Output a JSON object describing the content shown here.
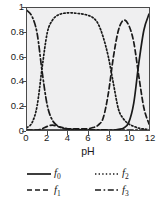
{
  "chart_data": {
    "type": "line",
    "title": "",
    "xlabel": "pH",
    "ylabel": "",
    "xlim": [
      0,
      12
    ],
    "ylim": [
      0,
      1
    ],
    "grid": false,
    "legend_position": "below",
    "xticks": [
      "0",
      "2",
      "4",
      "6",
      "8",
      "10",
      "12"
    ],
    "xtick_values": [
      0,
      2,
      4,
      6,
      8,
      10,
      12
    ],
    "yticks": [
      "0",
      "0.2",
      "0.4",
      "0.6",
      "0.8",
      "1"
    ],
    "ytick_values": [
      0,
      0.2,
      0.4,
      0.6,
      0.8,
      1
    ],
    "x": [
      0,
      0.5,
      1,
      1.5,
      2,
      2.5,
      3,
      3.5,
      4,
      4.5,
      5,
      5.5,
      6,
      6.5,
      7,
      7.5,
      8,
      8.5,
      9,
      9.5,
      10,
      10.5,
      11,
      11.5,
      12
    ],
    "series": [
      {
        "name": "f0",
        "label": "f",
        "subscript": "0",
        "linestyle": "solid",
        "color": "#1a1a1a",
        "values": [
          0,
          0,
          0,
          0,
          0,
          0,
          0,
          0,
          0,
          0,
          0,
          0,
          0,
          0,
          0,
          0,
          0,
          0,
          0.005,
          0.015,
          0.06,
          0.22,
          0.55,
          0.82,
          0.95
        ]
      },
      {
        "name": "f1",
        "label": "f",
        "subscript": "1",
        "linestyle": "dashed",
        "color": "#1a1a1a",
        "values": [
          0,
          0,
          0,
          0.01,
          0.03,
          0.04,
          0.03,
          0.02,
          0.01,
          0.01,
          0.01,
          0.01,
          0.01,
          0.02,
          0.04,
          0.1,
          0.3,
          0.6,
          0.82,
          0.9,
          0.86,
          0.72,
          0.44,
          0.18,
          0.05
        ]
      },
      {
        "name": "f2",
        "label": "f",
        "subscript": "2",
        "linestyle": "dotted",
        "color": "#1a1a1a",
        "values": [
          0.02,
          0.06,
          0.2,
          0.52,
          0.8,
          0.9,
          0.94,
          0.955,
          0.96,
          0.96,
          0.955,
          0.95,
          0.94,
          0.92,
          0.87,
          0.76,
          0.6,
          0.38,
          0.17,
          0.09,
          0.05,
          0.03,
          0.015,
          0.008,
          0.004
        ]
      },
      {
        "name": "f3",
        "label": "f",
        "subscript": "3",
        "linestyle": "dashdot",
        "color": "#1a1a1a",
        "values": [
          0.98,
          0.93,
          0.79,
          0.47,
          0.2,
          0.08,
          0.035,
          0.015,
          0.008,
          0.005,
          0.003,
          0.002,
          0.002,
          0.001,
          0.001,
          0.001,
          0,
          0,
          0,
          0,
          0,
          0,
          0,
          0,
          0
        ]
      }
    ],
    "legend": [
      {
        "name": "f0",
        "label": "f",
        "subscript": "0",
        "linestyle": "solid"
      },
      {
        "name": "f2",
        "label": "f",
        "subscript": "2",
        "linestyle": "dotted"
      },
      {
        "name": "f1",
        "label": "f",
        "subscript": "1",
        "linestyle": "dashed"
      },
      {
        "name": "f3",
        "label": "f",
        "subscript": "3",
        "linestyle": "dashdot"
      }
    ],
    "colors": {
      "plot_background": "#efeff0",
      "axis": "#4a4a4a",
      "line": "#1a1a1a",
      "text": "#1a1a1a",
      "figure_background": "#ffffff"
    }
  }
}
